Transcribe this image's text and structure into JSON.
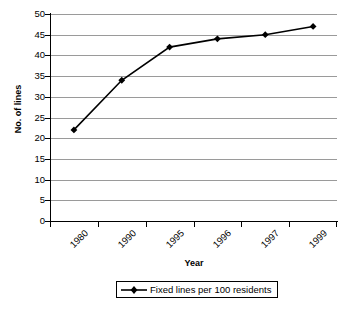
{
  "chart_data": {
    "type": "line",
    "title": "",
    "xlabel": "Year",
    "ylabel": "No. of lines",
    "categories": [
      "1980",
      "1990",
      "1995",
      "1996",
      "1997",
      "1999"
    ],
    "series": [
      {
        "name": "Fixed lines per 100 residents",
        "values": [
          22,
          34,
          42,
          44,
          45,
          47
        ]
      }
    ],
    "ylim": [
      0,
      50
    ],
    "yticks": [
      0,
      5,
      10,
      15,
      20,
      25,
      30,
      35,
      40,
      45,
      50
    ],
    "ytick_labels": [
      "0",
      "5",
      "10",
      "15",
      "20",
      "25",
      "30",
      "35",
      "40",
      "45",
      "50"
    ],
    "grid": "horizontal",
    "legend_position": "bottom",
    "colors": {
      "line": "#000000",
      "marker": "#000000",
      "gridline": "#9a9a9a",
      "axis": "#000000",
      "background": "#ffffff"
    },
    "marker": "diamond"
  },
  "legend": {
    "entries": [
      {
        "label": "Fixed lines per 100 residents",
        "marker": "diamond-marker"
      }
    ]
  }
}
